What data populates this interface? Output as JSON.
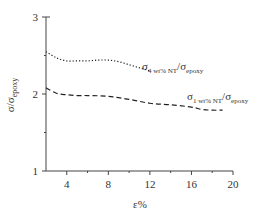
{
  "chart_data": {
    "type": "line",
    "title": "",
    "xlabel": "ε%",
    "ylabel": "σ/σepoxy",
    "ylabel_parts": {
      "main": "σ/σ",
      "sub": "epoxy"
    },
    "xlim": [
      2,
      20
    ],
    "ylim": [
      1,
      3
    ],
    "xticks": [
      4,
      8,
      12,
      16,
      20
    ],
    "xtick_labels": [
      "4",
      "8",
      "12",
      "16",
      "20"
    ],
    "yticks": [
      1,
      2,
      3
    ],
    "ytick_labels": [
      "1",
      "2",
      "3"
    ],
    "grid": false,
    "legend_position": "inline annotations",
    "series": [
      {
        "name": "σ4 wt% NT/σepoxy",
        "label_parts": {
          "s1": "σ",
          "sub1": "4 wt% NT",
          "mid": "/σ",
          "sub2": "epoxy"
        },
        "style": "dotted",
        "x": [
          2,
          3,
          4,
          5,
          6,
          7,
          8,
          9,
          10,
          11,
          12
        ],
        "values": [
          2.55,
          2.47,
          2.43,
          2.43,
          2.43,
          2.44,
          2.44,
          2.42,
          2.38,
          2.34,
          2.3
        ]
      },
      {
        "name": "σ1 wt% NT/σepoxy",
        "label_parts": {
          "s1": "σ",
          "sub1": "1 wt% NT",
          "mid": "/σ",
          "sub2": "epoxy"
        },
        "style": "dashed",
        "x": [
          2,
          3,
          4,
          5,
          6,
          8,
          10,
          12,
          14,
          16,
          17,
          18,
          19
        ],
        "values": [
          2.08,
          2.01,
          1.99,
          1.98,
          1.98,
          1.97,
          1.93,
          1.88,
          1.86,
          1.83,
          1.8,
          1.79,
          1.79
        ]
      }
    ]
  },
  "colors": {
    "axis": "#444444",
    "line": "#222222",
    "text": "#333333"
  }
}
